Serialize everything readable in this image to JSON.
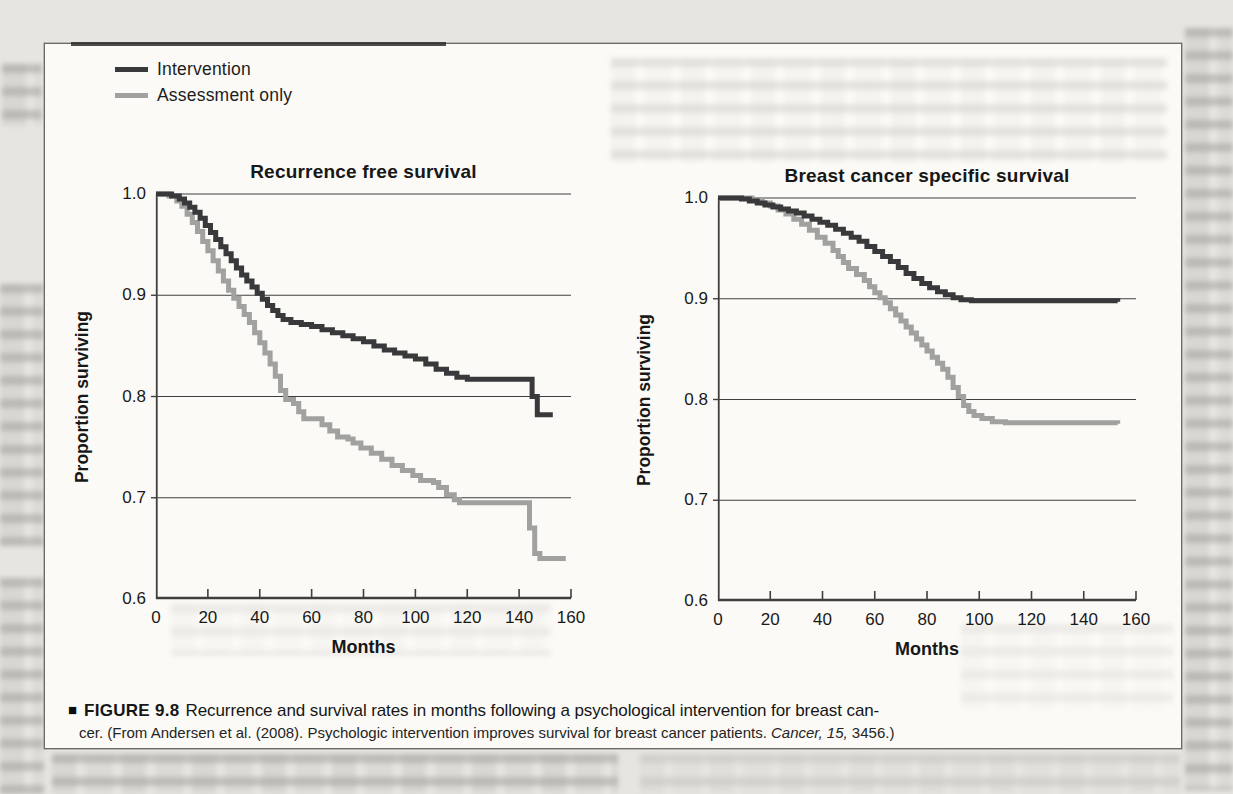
{
  "figure": {
    "caption": {
      "bullet": "■",
      "label": "FIGURE 9.8",
      "line1": "Recurrence and survival rates in months following a psychological intervention for breast can-",
      "line2_prefix": "cer.  (From Andersen et al. (2008). Psychologic intervention improves survival for breast cancer patients. ",
      "citation_italic": "Cancer, 15,",
      "line2_suffix": " 3456.)"
    },
    "legend": {
      "items": [
        {
          "label": "Intervention",
          "color": "#39393b"
        },
        {
          "label": "Assessment only",
          "color": "#a1a19f"
        }
      ]
    },
    "colors": {
      "intervention": "#39393b",
      "assessment_only": "#a1a19f",
      "axis": "#3f3f3f",
      "paper": "#fbfaf6",
      "page_background": "#e7e5e0"
    }
  },
  "chart_data": [
    {
      "type": "line",
      "subtype": "kaplan-meier-step",
      "title": "Recurrence free survival",
      "xlabel": "Months",
      "ylabel": "Proportion surviving",
      "xlim": [
        0,
        160
      ],
      "ylim": [
        0.6,
        1.0
      ],
      "xticks": [
        0,
        20,
        40,
        60,
        80,
        100,
        120,
        140,
        160
      ],
      "yticks": [
        "1.0",
        "0.9",
        "0.8",
        "0.7",
        "0.6"
      ],
      "gridlines": [
        1.0,
        0.9,
        0.8,
        0.7
      ],
      "grid": "horizontal",
      "legend_position": "above-top-left",
      "series": [
        {
          "name": "Intervention",
          "color": "#39393b",
          "points": [
            [
              0,
              1.0
            ],
            [
              6,
              0.998
            ],
            [
              9,
              0.995
            ],
            [
              11,
              0.991
            ],
            [
              13,
              0.987
            ],
            [
              15,
              0.982
            ],
            [
              17,
              0.976
            ],
            [
              19,
              0.969
            ],
            [
              21,
              0.962
            ],
            [
              23,
              0.955
            ],
            [
              25,
              0.948
            ],
            [
              27,
              0.941
            ],
            [
              29,
              0.934
            ],
            [
              31,
              0.927
            ],
            [
              33,
              0.92
            ],
            [
              35,
              0.914
            ],
            [
              37,
              0.908
            ],
            [
              39,
              0.902
            ],
            [
              41,
              0.896
            ],
            [
              43,
              0.89
            ],
            [
              45,
              0.885
            ],
            [
              47,
              0.88
            ],
            [
              49,
              0.876
            ],
            [
              52,
              0.873
            ],
            [
              56,
              0.871
            ],
            [
              60,
              0.869
            ],
            [
              64,
              0.866
            ],
            [
              68,
              0.863
            ],
            [
              72,
              0.86
            ],
            [
              76,
              0.857
            ],
            [
              80,
              0.854
            ],
            [
              84,
              0.85
            ],
            [
              88,
              0.846
            ],
            [
              92,
              0.843
            ],
            [
              96,
              0.84
            ],
            [
              100,
              0.837
            ],
            [
              104,
              0.832
            ],
            [
              108,
              0.827
            ],
            [
              112,
              0.823
            ],
            [
              116,
              0.819
            ],
            [
              120,
              0.817
            ],
            [
              143,
              0.817
            ],
            [
              145,
              0.8
            ],
            [
              147,
              0.782
            ],
            [
              153,
              0.782
            ]
          ]
        },
        {
          "name": "Assessment only",
          "color": "#a1a19f",
          "points": [
            [
              0,
              1.0
            ],
            [
              5,
              0.998
            ],
            [
              8,
              0.993
            ],
            [
              10,
              0.988
            ],
            [
              12,
              0.98
            ],
            [
              14,
              0.972
            ],
            [
              16,
              0.963
            ],
            [
              18,
              0.953
            ],
            [
              20,
              0.944
            ],
            [
              22,
              0.934
            ],
            [
              24,
              0.924
            ],
            [
              26,
              0.914
            ],
            [
              28,
              0.905
            ],
            [
              30,
              0.897
            ],
            [
              32,
              0.889
            ],
            [
              34,
              0.881
            ],
            [
              36,
              0.873
            ],
            [
              38,
              0.863
            ],
            [
              40,
              0.853
            ],
            [
              42,
              0.843
            ],
            [
              44,
              0.832
            ],
            [
              46,
              0.82
            ],
            [
              48,
              0.806
            ],
            [
              50,
              0.797
            ],
            [
              53,
              0.793
            ],
            [
              55,
              0.785
            ],
            [
              57,
              0.778
            ],
            [
              62,
              0.778
            ],
            [
              64,
              0.772
            ],
            [
              67,
              0.766
            ],
            [
              70,
              0.76
            ],
            [
              74,
              0.758
            ],
            [
              76,
              0.754
            ],
            [
              79,
              0.749
            ],
            [
              83,
              0.744
            ],
            [
              87,
              0.738
            ],
            [
              91,
              0.732
            ],
            [
              95,
              0.727
            ],
            [
              99,
              0.722
            ],
            [
              102,
              0.717
            ],
            [
              107,
              0.715
            ],
            [
              109,
              0.71
            ],
            [
              112,
              0.703
            ],
            [
              115,
              0.698
            ],
            [
              117,
              0.695
            ],
            [
              142,
              0.695
            ],
            [
              144,
              0.67
            ],
            [
              146,
              0.645
            ],
            [
              148,
              0.64
            ],
            [
              158,
              0.64
            ]
          ]
        }
      ]
    },
    {
      "type": "line",
      "subtype": "kaplan-meier-step",
      "title": "Breast cancer specific survival",
      "xlabel": "Months",
      "ylabel": "Proportion surviving",
      "xlim": [
        0,
        160
      ],
      "ylim": [
        0.6,
        1.0
      ],
      "xticks": [
        0,
        20,
        40,
        60,
        80,
        100,
        120,
        140,
        160
      ],
      "yticks": [
        "1.0",
        "0.9",
        "0.8",
        "0.7",
        "0.6"
      ],
      "gridlines": [
        1.0,
        0.9,
        0.8,
        0.7
      ],
      "grid": "horizontal",
      "legend_position": "none",
      "series": [
        {
          "name": "Intervention",
          "color": "#39393b",
          "points": [
            [
              0,
              1.0
            ],
            [
              9,
              0.999
            ],
            [
              12,
              0.997
            ],
            [
              15,
              0.995
            ],
            [
              18,
              0.993
            ],
            [
              21,
              0.991
            ],
            [
              24,
              0.989
            ],
            [
              27,
              0.987
            ],
            [
              30,
              0.985
            ],
            [
              33,
              0.982
            ],
            [
              36,
              0.979
            ],
            [
              39,
              0.976
            ],
            [
              42,
              0.973
            ],
            [
              45,
              0.969
            ],
            [
              48,
              0.965
            ],
            [
              51,
              0.961
            ],
            [
              54,
              0.957
            ],
            [
              57,
              0.952
            ],
            [
              60,
              0.947
            ],
            [
              63,
              0.942
            ],
            [
              66,
              0.937
            ],
            [
              69,
              0.931
            ],
            [
              72,
              0.925
            ],
            [
              75,
              0.92
            ],
            [
              78,
              0.915
            ],
            [
              81,
              0.911
            ],
            [
              84,
              0.907
            ],
            [
              87,
              0.904
            ],
            [
              90,
              0.901
            ],
            [
              93,
              0.899
            ],
            [
              97,
              0.898
            ],
            [
              153,
              0.897
            ]
          ]
        },
        {
          "name": "Assessment only",
          "color": "#a1a19f",
          "points": [
            [
              0,
              1.0
            ],
            [
              13,
              0.998
            ],
            [
              17,
              0.995
            ],
            [
              20,
              0.992
            ],
            [
              23,
              0.988
            ],
            [
              26,
              0.984
            ],
            [
              29,
              0.979
            ],
            [
              32,
              0.974
            ],
            [
              35,
              0.968
            ],
            [
              38,
              0.961
            ],
            [
              41,
              0.955
            ],
            [
              44,
              0.948
            ],
            [
              46,
              0.942
            ],
            [
              48,
              0.936
            ],
            [
              50,
              0.93
            ],
            [
              53,
              0.924
            ],
            [
              56,
              0.918
            ],
            [
              58,
              0.912
            ],
            [
              60,
              0.906
            ],
            [
              62,
              0.901
            ],
            [
              64,
              0.896
            ],
            [
              66,
              0.89
            ],
            [
              68,
              0.884
            ],
            [
              70,
              0.878
            ],
            [
              72,
              0.872
            ],
            [
              74,
              0.866
            ],
            [
              76,
              0.86
            ],
            [
              78,
              0.854
            ],
            [
              80,
              0.848
            ],
            [
              82,
              0.842
            ],
            [
              84,
              0.836
            ],
            [
              86,
              0.83
            ],
            [
              88,
              0.822
            ],
            [
              90,
              0.812
            ],
            [
              92,
              0.803
            ],
            [
              94,
              0.794
            ],
            [
              96,
              0.788
            ],
            [
              98,
              0.784
            ],
            [
              101,
              0.781
            ],
            [
              105,
              0.778
            ],
            [
              110,
              0.777
            ],
            [
              153,
              0.776
            ]
          ]
        }
      ]
    }
  ]
}
